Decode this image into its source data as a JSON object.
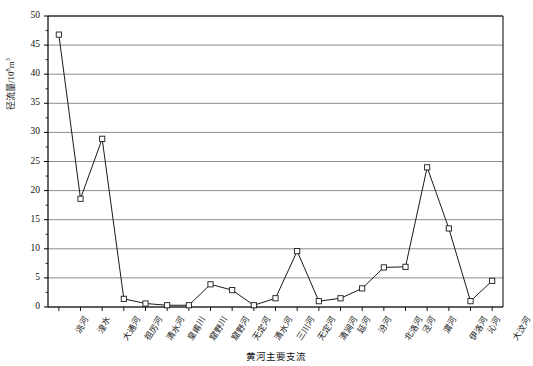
{
  "chart_data": {
    "type": "line",
    "title": "",
    "xlabel": "黄河主要支流",
    "ylabel_prefix": "径流量/10",
    "ylabel_sup": "8",
    "ylabel_suffix": "m",
    "ylabel_sup2": "3",
    "ylabel_full": "径流量/10⁸m³",
    "ylim": [
      0,
      50
    ],
    "ytick_step": 5,
    "yticks": [
      "0",
      "5",
      "10",
      "15",
      "20",
      "25",
      "30",
      "35",
      "40",
      "45",
      "50"
    ],
    "grid": true,
    "grid_axis": "y",
    "legend": "none",
    "marker": "open-square",
    "line_color": "#1a1a1a",
    "grid_color": "#808080",
    "axis_color": "#000000",
    "categories": [
      "洮河",
      "湟水",
      "大通河",
      "祖厉河",
      "清水河",
      "皇甫川",
      "窟野川",
      "窟野河",
      "无定河",
      "清水河",
      "三川河",
      "无定河",
      "清涧河",
      "延河",
      "汾河",
      "北洛河",
      "泾河",
      "渭河",
      "伊洛河",
      "沁河",
      "大汶河"
    ],
    "values": [
      46.8,
      18.6,
      28.9,
      1.4,
      0.6,
      0.3,
      0.3,
      3.9,
      2.9,
      0.3,
      1.5,
      9.6,
      1.0,
      1.5,
      3.2,
      6.8,
      6.9,
      24.0,
      13.5,
      1.0,
      4.5
    ]
  }
}
